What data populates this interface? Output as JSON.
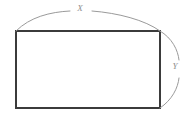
{
  "figure": {
    "type": "geometry-diagram",
    "shape": "rectangle",
    "background_color": "#ffffff",
    "rect": {
      "stroke_color": "#3b3b3b",
      "stroke_width": 2,
      "fill": "none",
      "left": 15,
      "top": 30,
      "right": 160,
      "bottom": 108,
      "width": 145,
      "height": 78
    },
    "braces": {
      "stroke_color": "#9a9a9a",
      "stroke_width": 1,
      "top": {
        "name": "width-brace",
        "orientation": "horizontal",
        "spans": "top edge",
        "gap_for_label": true
      },
      "right": {
        "name": "height-brace",
        "orientation": "vertical",
        "spans": "right edge",
        "gap_for_label": true
      }
    },
    "labels": {
      "width": "X",
      "height": "Y",
      "color": "#8e8e8e",
      "style": "italic"
    }
  }
}
